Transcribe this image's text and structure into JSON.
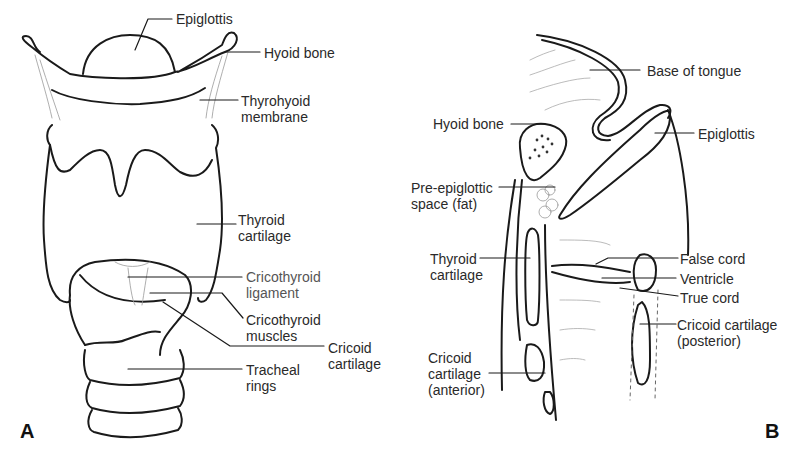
{
  "figure": {
    "panels": [
      {
        "id": "A",
        "label": "A",
        "view": "anterior view of larynx",
        "labels": [
          {
            "key": "epiglottis",
            "lines": [
              "Epiglottis"
            ]
          },
          {
            "key": "hyoid_bone",
            "lines": [
              "Hyoid bone"
            ]
          },
          {
            "key": "thyrohyoid_membrane",
            "lines": [
              "Thyrohyoid",
              "membrane"
            ]
          },
          {
            "key": "thyroid_cartilage",
            "lines": [
              "Thyroid",
              "cartilage"
            ]
          },
          {
            "key": "cricothyroid_ligament",
            "lines": [
              "Cricothyroid",
              "ligament"
            ]
          },
          {
            "key": "cricothyroid_muscles",
            "lines": [
              "Cricothyroid",
              "muscles"
            ]
          },
          {
            "key": "cricoid_cartilage",
            "lines": [
              "Cricoid",
              "cartilage"
            ]
          },
          {
            "key": "tracheal_rings",
            "lines": [
              "Tracheal",
              "rings"
            ]
          }
        ]
      },
      {
        "id": "B",
        "label": "B",
        "view": "sagittal section of larynx",
        "labels": [
          {
            "key": "base_of_tongue",
            "lines": [
              "Base of tongue"
            ]
          },
          {
            "key": "hyoid_bone",
            "lines": [
              "Hyoid bone"
            ]
          },
          {
            "key": "epiglottis",
            "lines": [
              "Epiglottis"
            ]
          },
          {
            "key": "pre_epiglottic_space",
            "lines": [
              "Pre-epiglottic",
              "space (fat)"
            ]
          },
          {
            "key": "thyroid_cartilage",
            "lines": [
              "Thyroid",
              "cartilage"
            ]
          },
          {
            "key": "false_cord",
            "lines": [
              "False cord"
            ]
          },
          {
            "key": "ventricle",
            "lines": [
              "Ventricle"
            ]
          },
          {
            "key": "true_cord",
            "lines": [
              "True cord"
            ]
          },
          {
            "key": "cricoid_posterior",
            "lines": [
              "Cricoid cartilage",
              "(posterior)"
            ]
          },
          {
            "key": "cricoid_anterior",
            "lines": [
              "Cricoid",
              "cartilage",
              "(anterior)"
            ]
          }
        ]
      }
    ]
  }
}
